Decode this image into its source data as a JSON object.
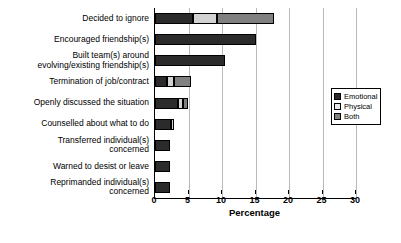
{
  "chart_data": {
    "type": "bar",
    "orientation": "horizontal",
    "stacked": true,
    "title": "",
    "xlabel": "Percentage",
    "ylabel": "",
    "xlim": [
      0,
      30
    ],
    "xticks": [
      0,
      5,
      10,
      15,
      20,
      25,
      30
    ],
    "grid": true,
    "legend_position": "right",
    "categories": [
      "Decided to ignore",
      "Encouraged friendship(s)",
      "Built team(s) around evolving/existing friendship(s)",
      "Termination of job/contract",
      "Openly discussed the situation",
      "Counselled about what to do",
      "Transferred individual(s) concerned",
      "Warned to desist or leave",
      "Reprimanded individual(s) concerned"
    ],
    "category_lines": [
      [
        "Decided to ignore"
      ],
      [
        "Encouraged friendship(s)"
      ],
      [
        "Built team(s) around",
        "evolving/existing friendship(s)"
      ],
      [
        "Termination of job/contract"
      ],
      [
        "Openly discussed the situation"
      ],
      [
        "Counselled about what to do"
      ],
      [
        "Transferred individual(s)",
        "concerned"
      ],
      [
        "Warned to desist or leave"
      ],
      [
        "Reprimanded individual(s)",
        "concerned"
      ]
    ],
    "series": [
      {
        "name": "Emotional",
        "color": "#2b2b2b",
        "values": [
          5.7,
          15.0,
          10.5,
          1.8,
          3.5,
          2.4,
          2.2,
          2.2,
          2.2
        ]
      },
      {
        "name": "Physical",
        "color": "#d2d2d2",
        "values": [
          3.5,
          0.0,
          0.0,
          1.1,
          0.7,
          0.4,
          0.0,
          0.0,
          0.0
        ]
      },
      {
        "name": "Both",
        "color": "#808080",
        "values": [
          8.6,
          0.0,
          0.0,
          2.5,
          0.8,
          0.0,
          0.0,
          0.0,
          0.0
        ]
      }
    ],
    "totals": [
      17.8,
      15.0,
      10.5,
      5.4,
      5.0,
      2.8,
      2.2,
      2.2,
      2.2
    ]
  },
  "legend": {
    "items": [
      {
        "label": "Emotional"
      },
      {
        "label": "Physical"
      },
      {
        "label": "Both"
      }
    ]
  }
}
